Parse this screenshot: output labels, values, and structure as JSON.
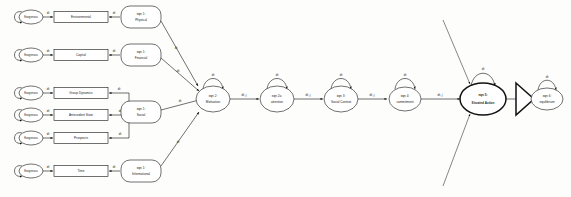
{
  "diagram": {
    "type": "node-link-graph",
    "background": "#fdfdfb",
    "stroke_color": "#111111",
    "fill_color": "#ffffff",
    "self_loop_label": "dt",
    "exogenous_label": "Exogenous",
    "left_rows": [
      {
        "id": "row-environmental",
        "source_label": "Exogenous",
        "box_label": "Environmental",
        "eqn_line1": "eqn 1:",
        "eqn_line2": "Physical",
        "edge_in_label": "dt",
        "edge_out_label": "dt"
      },
      {
        "id": "row-capital",
        "source_label": "Exogenous",
        "box_label": "Capital",
        "eqn_line1": "eqn 1:",
        "eqn_line2": "Financial",
        "edge_in_label": "dt",
        "edge_out_label": "dt"
      },
      {
        "id": "row-group-dynamics",
        "source_label": "Exogenous",
        "box_label": "Group Dynamics",
        "eqn_line1": "eqn 1:",
        "eqn_line2": "Social",
        "edge_in_label": "dt",
        "edge_out_label": "dt"
      },
      {
        "id": "row-antecedent-state",
        "source_label": "Exogenous",
        "box_label": "Antecedent State",
        "eqn_line1": "",
        "eqn_line2": "",
        "edge_in_label": "dt",
        "edge_out_label": "dt"
      },
      {
        "id": "row-prospects",
        "source_label": "Exogenous",
        "box_label": "Prospects",
        "eqn_line1": "",
        "eqn_line2": "",
        "edge_in_label": "dt",
        "edge_out_label": "dt"
      },
      {
        "id": "row-time",
        "source_label": "Exogenous",
        "box_label": "Time",
        "eqn_line1": "eqn 1:",
        "eqn_line2": "Informational",
        "edge_in_label": "dt",
        "edge_out_label": "dt"
      }
    ],
    "chain_nodes": [
      {
        "id": "node-motivation",
        "line1": "eqn 2:",
        "line2": "Motivation",
        "loop_label": "dt",
        "bold": false
      },
      {
        "id": "node-attention",
        "line1": "eqn 2a:",
        "line2": "attention",
        "loop_label": "dt",
        "bold": false
      },
      {
        "id": "node-social-context",
        "line1": "eqn 3:",
        "line2": "Social Context",
        "loop_label": "dt",
        "bold": false
      },
      {
        "id": "node-commitment",
        "line1": "eqn 4:",
        "line2": "commitment",
        "loop_label": "dt",
        "bold": false
      },
      {
        "id": "node-situated-action",
        "line1": "eqn 5:",
        "line2": "Situated Action",
        "loop_label": "dt",
        "bold": true
      },
      {
        "id": "node-equilibrium",
        "line1": "eqn 6:",
        "line2": "equilibrium",
        "loop_label": "dt",
        "bold": false
      }
    ],
    "chain_edges": [
      {
        "id": "edge-motivation-attention",
        "label": "dt, j"
      },
      {
        "id": "edge-attention-social-context",
        "label": "dt, j"
      },
      {
        "id": "edge-social-context-commitment",
        "label": "dt, j"
      },
      {
        "id": "edge-commitment-situated-action",
        "label": "dt, j"
      }
    ],
    "feeder_edge_labels": [
      "dt",
      "dt",
      "dt",
      "dt"
    ]
  }
}
